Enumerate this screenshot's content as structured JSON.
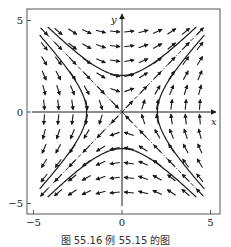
{
  "chart_data": {
    "type": "vector_field",
    "title": "",
    "caption": "图 55.16  例 55.15 的图",
    "xlabel": "x",
    "ylabel": "y",
    "xlim": [
      -5.4,
      5.5
    ],
    "ylim": [
      -5.6,
      5.6
    ],
    "xticks": [
      -5,
      0,
      5
    ],
    "yticks": [
      -5,
      0,
      5
    ],
    "xtick_labels": [
      "−5",
      "0",
      "5"
    ],
    "ytick_labels": [
      "−5",
      "0",
      "5"
    ],
    "grid": false,
    "system": {
      "dx": "y",
      "dy": "x",
      "equilibrium": [
        0,
        0
      ],
      "type": "saddle"
    },
    "field_grid": {
      "x_start": -4.4,
      "x_end": 4.4,
      "y_start": -4.4,
      "y_end": 4.4,
      "step": 0.8
    },
    "separatrices": [
      {
        "name": "unstable eigenline",
        "equation": "y = x",
        "style": "dash-dot",
        "range": [
          -4.6,
          4.6
        ]
      },
      {
        "name": "stable eigenline",
        "equation": "y = -x",
        "style": "dash-dot",
        "range": [
          -4.6,
          4.6
        ]
      }
    ],
    "trajectories": [
      {
        "name": "upper hyperbola",
        "equation": "y^2 - x^2 = 4",
        "branch": "y>0",
        "x_range": [
          -4.2,
          4.2
        ]
      },
      {
        "name": "lower hyperbola",
        "equation": "y^2 - x^2 = 4",
        "branch": "y<0",
        "x_range": [
          -4.2,
          4.2
        ]
      },
      {
        "name": "right hyperbola",
        "equation": "x^2 - y^2 = 4",
        "branch": "x>0",
        "y_range": [
          -4.2,
          4.2
        ]
      },
      {
        "name": "left hyperbola",
        "equation": "x^2 - y^2 = 4",
        "branch": "x<0",
        "y_range": [
          -4.2,
          4.2
        ]
      }
    ],
    "colors": {
      "ink": "#1a1a1a",
      "frame": "#555555",
      "background": "#ffffff"
    }
  },
  "figure": {
    "caption": "图 55.16  例 55.15 的图",
    "x_axis_label": "x",
    "y_axis_label": "y"
  }
}
